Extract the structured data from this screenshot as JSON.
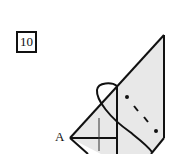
{
  "diagram": {
    "step_number": "10",
    "point_label": "A",
    "colors": {
      "paper": "#e8e8e8",
      "line": "#111111",
      "background": "#ffffff"
    },
    "elements": [
      "step-number-box",
      "folded-paper-shape",
      "valley-fold-dash-dot-line",
      "curved-fold-arrow",
      "crease-cross",
      "point-a-label"
    ]
  }
}
